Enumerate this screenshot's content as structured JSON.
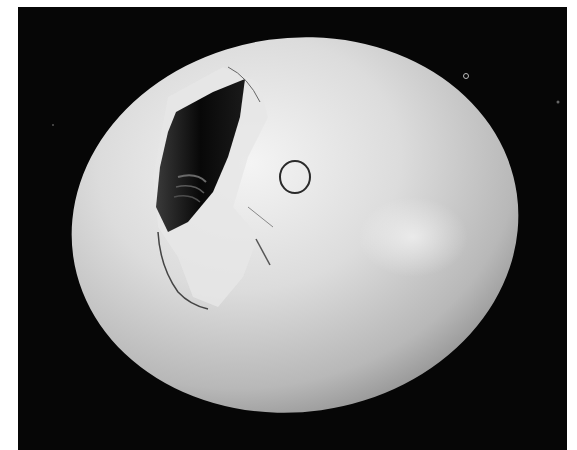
{
  "image": {
    "subject": "cracked white egg",
    "description": "Black-and-white photograph of a white egg on a black background; the upper-left of the shell is broken open, exposing a dark interior, and a small hand-drawn circle is marked on the shell.",
    "colors": {
      "background": "#060606",
      "shell_highlight": "#f2f2f2",
      "shell_mid": "#c9c9c9",
      "shell_shadow": "#8f8f8f",
      "hole": "#0c0c0c",
      "page_margin": "#ffffff"
    }
  },
  "page": {
    "margin_number": "6"
  }
}
